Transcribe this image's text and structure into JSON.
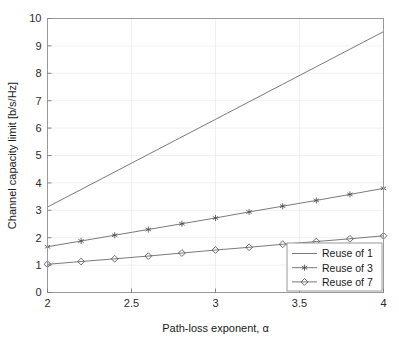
{
  "chart_data": {
    "type": "line",
    "title": "",
    "xlabel": "Path-loss exponent, α",
    "ylabel": "Channel capacity limit [b/s/Hz]",
    "xlim": [
      2,
      4
    ],
    "ylim": [
      0,
      10
    ],
    "xticks": [
      2,
      2.5,
      3,
      3.5,
      4
    ],
    "xticklabels": [
      "2",
      "2.5",
      "3",
      "3.5",
      "4"
    ],
    "yticks": [
      0,
      1,
      2,
      3,
      4,
      5,
      6,
      7,
      8,
      9,
      10
    ],
    "yticklabels": [
      "0",
      "1",
      "2",
      "3",
      "4",
      "5",
      "6",
      "7",
      "8",
      "9",
      "10"
    ],
    "grid": true,
    "legend_position": "lower right",
    "x": [
      2.0,
      2.2,
      2.4,
      2.6,
      2.8,
      3.0,
      3.2,
      3.4,
      3.6,
      3.8,
      4.0
    ],
    "series": [
      {
        "name": "Reuse of 1",
        "marker": "none",
        "values": [
          3.12,
          3.76,
          4.4,
          5.04,
          5.68,
          6.32,
          6.96,
          7.6,
          8.24,
          8.88,
          9.52
        ]
      },
      {
        "name": "Reuse of 3",
        "marker": "asterisk",
        "values": [
          1.67,
          1.88,
          2.09,
          2.3,
          2.51,
          2.72,
          2.94,
          3.15,
          3.36,
          3.58,
          3.8
        ]
      },
      {
        "name": "Reuse of 7",
        "marker": "diamond",
        "values": [
          1.03,
          1.13,
          1.23,
          1.33,
          1.44,
          1.55,
          1.65,
          1.76,
          1.86,
          1.96,
          2.07
        ]
      }
    ]
  },
  "colors": {
    "series_line": "#6b6b6b",
    "grid": "#e6e6e6",
    "frame": "#9a9a9a",
    "text": "#1a1a1a",
    "background": "#ffffff"
  },
  "legend": {
    "entries": [
      {
        "label": "Reuse of 1"
      },
      {
        "label": "Reuse of 3"
      },
      {
        "label": "Reuse of 7"
      }
    ]
  }
}
